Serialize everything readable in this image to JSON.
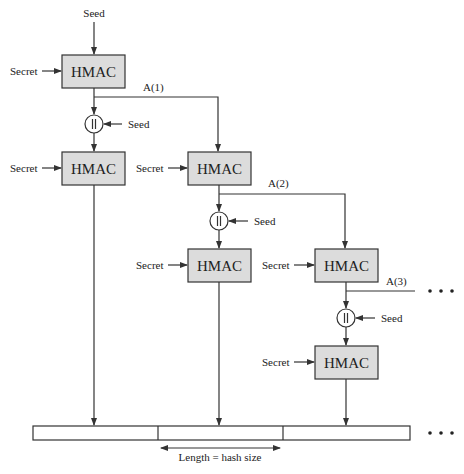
{
  "diagram": {
    "top_input": "Seed",
    "hmac_label": "HMAC",
    "secret_label": "Secret",
    "seed_label": "Seed",
    "concat_symbol": "||",
    "a_labels": [
      "A(1)",
      "A(2)",
      "A(3)"
    ],
    "continuation": "• • •",
    "length_label": "Length = hash size",
    "output_blocks": 3
  }
}
